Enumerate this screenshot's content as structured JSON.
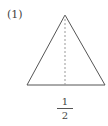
{
  "problem": {
    "label": "(1)"
  },
  "figure": {
    "shape": "isosceles-triangle",
    "apex": [
      65,
      15
    ],
    "base_left": [
      27,
      85
    ],
    "base_right": [
      105,
      85
    ],
    "altitude": "dashed",
    "stroke_color": "#555555",
    "altitude_color": "#999999"
  },
  "answer": {
    "numerator": "1",
    "denominator": "2"
  }
}
